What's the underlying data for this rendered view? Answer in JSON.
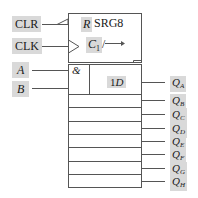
{
  "diagram": {
    "title": "SRG8",
    "type": "8-bit serial-in parallel-out shift register logic symbol",
    "inputs": [
      {
        "id": "clr",
        "label": "CLR",
        "italic": false
      },
      {
        "id": "clk",
        "label": "CLK",
        "italic": false
      },
      {
        "id": "a",
        "label": "A",
        "italic": true
      },
      {
        "id": "b",
        "label": "B",
        "italic": true
      }
    ],
    "control_block": {
      "reset_label": "R",
      "clock_label": "C",
      "clock_subscript": "1",
      "shift_indicator": "/→"
    },
    "first_stage": {
      "gate_label": "&",
      "data_label": "1D"
    },
    "outputs": [
      {
        "id": "qa",
        "label": "Q",
        "subscript": "A"
      },
      {
        "id": "qb",
        "label": "Q",
        "subscript": "B"
      },
      {
        "id": "qc",
        "label": "Q",
        "subscript": "C"
      },
      {
        "id": "qd",
        "label": "Q",
        "subscript": "D"
      },
      {
        "id": "qe",
        "label": "Q",
        "subscript": "E"
      },
      {
        "id": "qf",
        "label": "Q",
        "subscript": "F"
      },
      {
        "id": "qg",
        "label": "Q",
        "subscript": "G"
      },
      {
        "id": "qh",
        "label": "Q",
        "subscript": "H"
      }
    ]
  }
}
